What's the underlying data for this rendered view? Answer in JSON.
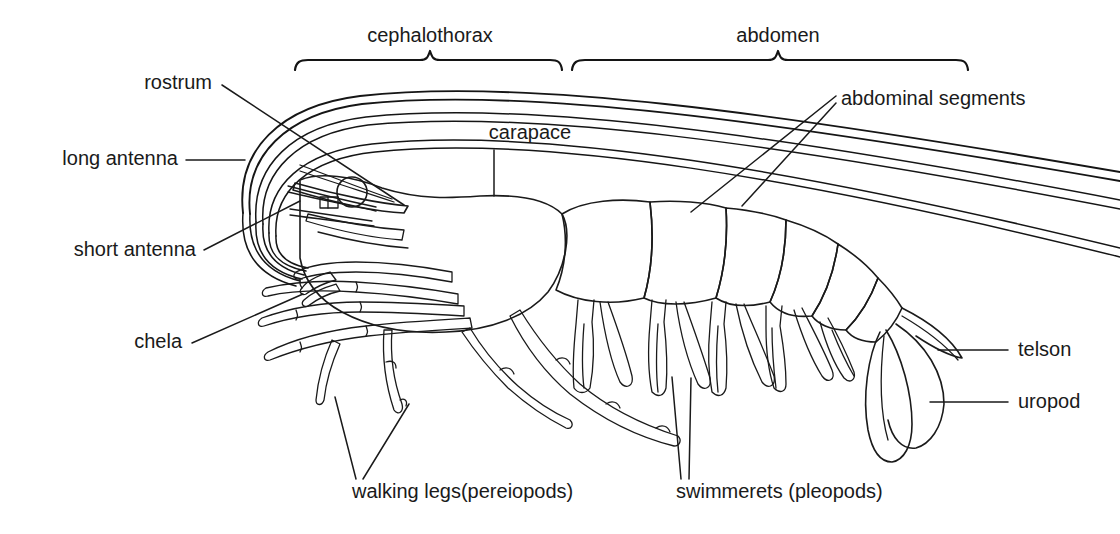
{
  "figure": {
    "background_color": "#ffffff",
    "line_color": "#1a1a1a",
    "text_color": "#1a1a1a"
  },
  "braces": [
    {
      "id": "cephalothorax",
      "label": "cephalothorax",
      "label_x": 430,
      "label_y": 42,
      "x_start": 295,
      "x_end": 562,
      "y": 62,
      "tick_x": 430
    },
    {
      "id": "abdomen",
      "label": "abdomen",
      "label_x": 778,
      "label_y": 42,
      "x_start": 572,
      "x_end": 968,
      "y": 62,
      "tick_x": 778
    }
  ],
  "labels": [
    {
      "id": "rostrum",
      "text": "rostrum",
      "x": 212,
      "y": 89,
      "anchor": "end"
    },
    {
      "id": "long-antenna",
      "text": "long antenna",
      "x": 178,
      "y": 165,
      "anchor": "end"
    },
    {
      "id": "short-antenna",
      "text": "short antenna",
      "x": 196,
      "y": 256,
      "anchor": "end"
    },
    {
      "id": "chela",
      "text": "chela",
      "x": 182,
      "y": 348,
      "anchor": "end"
    },
    {
      "id": "carapace",
      "text": "carapace",
      "x": 530,
      "y": 139,
      "anchor": "middle"
    },
    {
      "id": "abdominal-segments",
      "text": "abdominal segments",
      "x": 841,
      "y": 105,
      "anchor": "start"
    },
    {
      "id": "telson",
      "text": "telson",
      "x": 1018,
      "y": 356,
      "anchor": "start"
    },
    {
      "id": "uropod",
      "text": "uropod",
      "x": 1018,
      "y": 408,
      "anchor": "start"
    },
    {
      "id": "walking-legs",
      "text": "walking legs(pereiopods)",
      "x": 352,
      "y": 498,
      "anchor": "start"
    },
    {
      "id": "swimmerets",
      "text": "swimmerets (pleopods)",
      "x": 676,
      "y": 498,
      "anchor": "start"
    }
  ],
  "leaders": [
    {
      "id": "rostrum-leader",
      "d": "M 222 85 L 404 205"
    },
    {
      "id": "long-antenna-leader",
      "d": "M 186 160 L 245 160"
    },
    {
      "id": "short-antenna-leader",
      "d": "M 204 250 L 300 201"
    },
    {
      "id": "chela-leader",
      "d": "M 192 343 L 303 294"
    },
    {
      "id": "carapace-leader",
      "d": "M 494 150 L 494 196"
    },
    {
      "id": "abdominal-segments-l1",
      "d": "M 836 96 L 691 212"
    },
    {
      "id": "abdominal-segments-l2",
      "d": "M 836 103 L 742 206"
    },
    {
      "id": "telson-leader",
      "d": "M 1008 350 L 938 350"
    },
    {
      "id": "uropod-leader",
      "d": "M 1008 402 L 930 402"
    },
    {
      "id": "walking-legs-l1",
      "d": "M 356 479 L 335 397"
    },
    {
      "id": "walking-legs-l2",
      "d": "M 363 479 L 409 404"
    },
    {
      "id": "swimmerets-l1",
      "d": "M 681 479 L 672 377"
    },
    {
      "id": "swimmerets-l2",
      "d": "M 689 479 L 691 378"
    }
  ]
}
